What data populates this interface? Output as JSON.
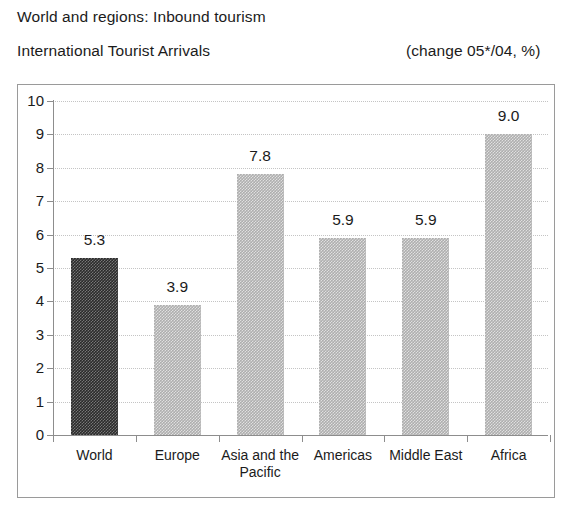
{
  "header": {
    "line1": "World and regions: Inbound tourism",
    "line2": "International Tourist Arrivals",
    "note": "(change 05*/04, %)"
  },
  "chart_data": {
    "type": "bar",
    "subtitle": "(change 05*/04, %)",
    "xlabel": "",
    "ylabel": "",
    "ylim": [
      0,
      10
    ],
    "ytick_step": 1,
    "yticks": [
      "10",
      "9",
      "8",
      "7",
      "6",
      "5",
      "4",
      "3",
      "2",
      "1",
      "0"
    ],
    "grid": true,
    "legend": "none",
    "categories": [
      "World",
      "Europe",
      "Asia and the Pacific",
      "Americas",
      "Middle East",
      "Africa"
    ],
    "values": [
      5.3,
      3.9,
      7.8,
      5.9,
      5.9,
      9.0
    ],
    "value_labels": [
      "5.3",
      "3.9",
      "7.8",
      "5.9",
      "5.9",
      "9.0"
    ],
    "bar_colors": [
      "#2b2b2b",
      "#aeaeae",
      "#aeaeae",
      "#aeaeae",
      "#aeaeae",
      "#aeaeae"
    ],
    "highlight_category": "World"
  },
  "colors": {
    "dark_bar": "#2b2b2b",
    "light_bar": "#aeaeae",
    "axis": "#8d8d8d",
    "grid": "#c4c4c4",
    "frame": "#9a9a9a",
    "text": "#1b1b1b",
    "background": "#ffffff"
  }
}
